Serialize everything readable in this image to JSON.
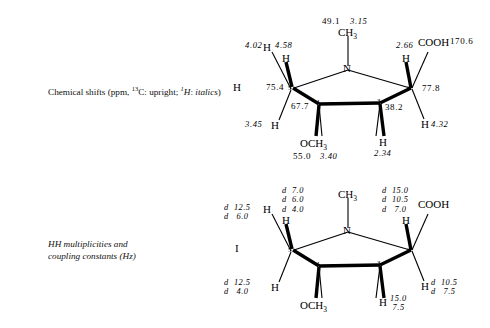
{
  "figure": {
    "background": "#ffffff",
    "ink": "#000000"
  },
  "panels": [
    {
      "id": "panel-top",
      "caption_lines": [
        "Chemical shifts (ppm, 13C: upright; 1H: italics)"
      ],
      "caption_rich": {
        "prefix": "Chemical shifts (ppm, ",
        "carbon_sup": "13",
        "carbon": "C: upright; ",
        "proton_sup": "1",
        "proton_italic": "H",
        "suffix": ": italics)"
      },
      "roman_label": "H",
      "structure": {
        "ring_atoms": [
          {
            "name": "N",
            "label": "N",
            "number": ""
          },
          {
            "name": "C5",
            "label": "",
            "number": "5"
          },
          {
            "name": "C4",
            "label": "",
            "number": "4"
          },
          {
            "name": "C3",
            "label": "",
            "number": "3"
          },
          {
            "name": "C2",
            "label": "",
            "number": "2"
          }
        ],
        "substituents": [
          {
            "name": "n-methyl",
            "label": "CH3"
          },
          {
            "name": "o-methyl",
            "label": "OCH3"
          },
          {
            "name": "carboxyl",
            "label": "COOH"
          },
          {
            "name": "h-c5-up",
            "label": "H"
          },
          {
            "name": "h-c5-down",
            "label": "H"
          },
          {
            "name": "h-c2-up",
            "label": "H"
          },
          {
            "name": "h-c2-down",
            "label": "H"
          },
          {
            "name": "h-c3-down",
            "label": "H"
          }
        ],
        "shifts": {
          "n_ch3_c13": "49.1",
          "n_ch3_h1": "3.15",
          "c5_c13": "75.4",
          "c5_h_up": "4.58",
          "c5_h_left": "4.02",
          "c5_h_down": "3.45",
          "c4_c13": "67.7",
          "och3_c13": "55.0",
          "och3_h1": "3.40",
          "c3_c13": "38.2",
          "c3_h_down": "2.34",
          "c2_c13": "77.8",
          "c2_h_up": "2.66",
          "c2_h_right": "4.32",
          "cooh_c13": "170.6"
        }
      }
    },
    {
      "id": "panel-bottom",
      "caption_lines": [
        "HH multiplicities and",
        "coupling constants (Hz)"
      ],
      "roman_label": "I",
      "structure": {
        "ring_atoms": [
          {
            "name": "N",
            "label": "N",
            "number": ""
          },
          {
            "name": "C5",
            "label": "",
            "number": "5"
          },
          {
            "name": "C4",
            "label": "",
            "number": "4"
          },
          {
            "name": "C3",
            "label": "",
            "number": "3"
          },
          {
            "name": "C2",
            "label": "",
            "number": "2"
          }
        ],
        "substituents": [
          {
            "name": "n-methyl",
            "label": "CH3"
          },
          {
            "name": "o-methyl",
            "label": "OCH3"
          },
          {
            "name": "carboxyl",
            "label": "COOH"
          },
          {
            "name": "h-c5-up",
            "label": "H"
          },
          {
            "name": "h-c5-left",
            "label": "H"
          },
          {
            "name": "h-c5-down",
            "label": "H"
          },
          {
            "name": "h-c2-up",
            "label": "H"
          },
          {
            "name": "h-c2-right",
            "label": "H"
          },
          {
            "name": "h-c3-down",
            "label": "H"
          }
        ],
        "couplings": {
          "c5_h_up": "d  7.0\nd  6.0\nd  4.0",
          "c5_h_left": "d  12.5\nd   6.0",
          "c5_h_down": "d  12.5\nd   4.0",
          "c2_h_up": "d  15.0\nd  10.5\nd   7.0",
          "c2_h_right": "d  10.5\nd   7.5",
          "c3_h_down": "15.0\n 7.5"
        }
      }
    }
  ]
}
